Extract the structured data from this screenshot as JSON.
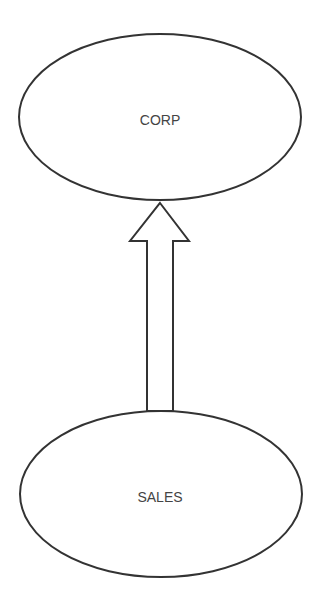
{
  "diagram": {
    "nodes": [
      {
        "id": "corp",
        "label": "CORP",
        "cx": 160,
        "cy": 117,
        "rx": 141,
        "ry": 83
      },
      {
        "id": "sales",
        "label": "SALES",
        "cx": 161,
        "cy": 494,
        "rx": 141,
        "ry": 83
      }
    ],
    "edges": [
      {
        "from": "sales",
        "to": "corp",
        "style": "hollow-block-arrow"
      }
    ],
    "colors": {
      "stroke": "#333333",
      "text": "#444444",
      "background": "#ffffff"
    }
  }
}
